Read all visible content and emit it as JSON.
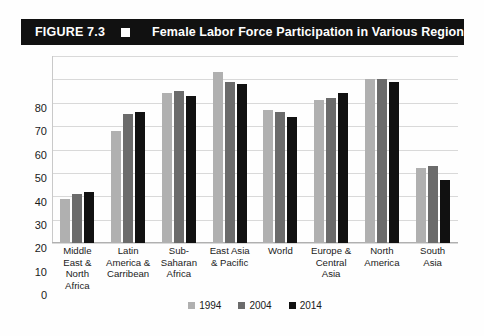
{
  "figure": {
    "number_label": "FIGURE 7.3",
    "title": "Female Labor Force Participation in Various Regions",
    "separator_icon": "white-square-icon",
    "header_bg": "#111111",
    "header_fg": "#ffffff"
  },
  "chart_data": {
    "type": "bar",
    "title": "Female Labor Force Participation in Various Regions",
    "xlabel": "",
    "ylabel": "",
    "ylim": [
      0,
      80
    ],
    "yticks": [
      80,
      70,
      60,
      50,
      40,
      30,
      20,
      10,
      0
    ],
    "grid": true,
    "legend_position": "bottom",
    "categories": [
      "Middle East & North Africa",
      "Latin America & Carribean",
      "Sub-Saharan Africa",
      "East Asia & Pacific",
      "World",
      "Europe & Central Asia",
      "North America",
      "South Asia"
    ],
    "category_lines": [
      [
        "Middle",
        "East &",
        "North Africa"
      ],
      [
        "Latin",
        "America &",
        "Carribean"
      ],
      [
        "Sub-",
        "Saharan",
        "Africa"
      ],
      [
        "East Asia",
        "& Pacific"
      ],
      [
        "World"
      ],
      [
        "Europe &",
        "Central",
        "Asia"
      ],
      [
        "North",
        "America"
      ],
      [
        "South",
        "Asia"
      ]
    ],
    "series": [
      {
        "name": "1994",
        "color": "#b0b0b0",
        "values": [
          19,
          48,
          64,
          73,
          57,
          61,
          70,
          32
        ]
      },
      {
        "name": "2004",
        "color": "#6b6b6b",
        "values": [
          21,
          55,
          65,
          69,
          56,
          62,
          70,
          33
        ]
      },
      {
        "name": "2014",
        "color": "#111111",
        "values": [
          22,
          56,
          63,
          68,
          54,
          64,
          69,
          27
        ]
      }
    ]
  }
}
